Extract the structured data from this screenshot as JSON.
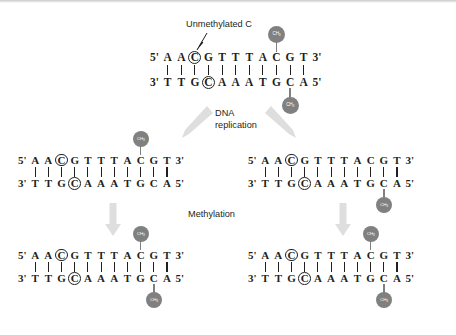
{
  "figure": {
    "title_callout": "Unmethylated C",
    "step_replication_line1": "DNA",
    "step_replication_line2": "replication",
    "step_methylation": "Methylation",
    "methyl_label": "CH",
    "methyl_subscript": "3",
    "colors": {
      "methyl_fill": "#808080",
      "methyl_text": "#ffffff",
      "arrow": "#dcdcdc",
      "base_text": "#231f20",
      "background": "#ffffff"
    }
  },
  "duplexes": {
    "parent": {
      "name": "parent-duplex",
      "five_prime_left": "5'",
      "three_prime_right": "3'",
      "three_prime_left": "3'",
      "five_prime_right": "5'",
      "top_bases": [
        "A",
        "A",
        "C",
        "G",
        "T",
        "T",
        "T",
        "A",
        "C",
        "G",
        "T"
      ],
      "bottom_bases": [
        "T",
        "T",
        "G",
        "C",
        "A",
        "A",
        "A",
        "T",
        "G",
        "C",
        "A"
      ],
      "top_circled_index": 2,
      "bottom_circled_index": 3,
      "top_methyl_index": 8,
      "bottom_methyl_index": 9,
      "bond_count": 11
    },
    "daughter_left": {
      "name": "daughter-left-duplex",
      "five_prime_left": "5'",
      "three_prime_right": "3'",
      "three_prime_left": "3'",
      "five_prime_right": "5'",
      "top_bases": [
        "A",
        "A",
        "C",
        "G",
        "T",
        "T",
        "T",
        "A",
        "C",
        "G",
        "T"
      ],
      "bottom_bases": [
        "T",
        "T",
        "G",
        "C",
        "A",
        "A",
        "A",
        "T",
        "G",
        "C",
        "A"
      ],
      "top_circled_index": 2,
      "bottom_circled_index": 3,
      "top_methyl_index": 8,
      "bottom_methyl_index": null,
      "bond_count": 11
    },
    "daughter_right": {
      "name": "daughter-right-duplex",
      "five_prime_left": "5'",
      "three_prime_right": "3'",
      "three_prime_left": "3'",
      "five_prime_right": "5'",
      "top_bases": [
        "A",
        "A",
        "C",
        "G",
        "T",
        "T",
        "T",
        "A",
        "C",
        "G",
        "T"
      ],
      "bottom_bases": [
        "T",
        "T",
        "G",
        "C",
        "A",
        "A",
        "A",
        "T",
        "G",
        "C",
        "A"
      ],
      "top_circled_index": 2,
      "bottom_circled_index": 3,
      "top_methyl_index": null,
      "bottom_methyl_index": 9,
      "bond_count": 11
    },
    "product_left": {
      "name": "product-left-duplex",
      "five_prime_left": "5'",
      "three_prime_right": "3'",
      "three_prime_left": "3'",
      "five_prime_right": "5'",
      "top_bases": [
        "A",
        "A",
        "C",
        "G",
        "T",
        "T",
        "T",
        "A",
        "C",
        "G",
        "T"
      ],
      "bottom_bases": [
        "T",
        "T",
        "G",
        "C",
        "A",
        "A",
        "A",
        "T",
        "G",
        "C",
        "A"
      ],
      "top_circled_index": 2,
      "bottom_circled_index": 3,
      "top_methyl_index": 8,
      "bottom_methyl_index": 9,
      "bond_count": 11
    },
    "product_right": {
      "name": "product-right-duplex",
      "five_prime_left": "5'",
      "three_prime_right": "3'",
      "three_prime_left": "3'",
      "five_prime_right": "5'",
      "top_bases": [
        "A",
        "A",
        "C",
        "G",
        "T",
        "T",
        "T",
        "A",
        "C",
        "G",
        "T"
      ],
      "bottom_bases": [
        "T",
        "T",
        "G",
        "C",
        "A",
        "A",
        "A",
        "T",
        "G",
        "C",
        "A"
      ],
      "top_circled_index": 2,
      "bottom_circled_index": 3,
      "top_methyl_index": 8,
      "bottom_methyl_index": 9,
      "bond_count": 11
    }
  }
}
